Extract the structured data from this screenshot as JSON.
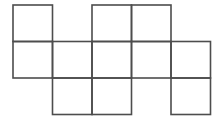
{
  "figure": {
    "name": "grid-square-net",
    "background_color": "#ffffff",
    "line_color": "#4d4d4d",
    "line_width": 1.6,
    "grid": {
      "columns": 5,
      "rows": 3,
      "cell_width": 39.5,
      "cell_height": 36.5,
      "origin_x": 13,
      "origin_y": 5,
      "column_edges_x": [
        13,
        52.5,
        92,
        131.5,
        171,
        210.5
      ],
      "row_edges_y": [
        5,
        41.5,
        78,
        114.5
      ]
    },
    "cells": [
      {
        "id": "cell-r1c1",
        "row": 1,
        "col": 1
      },
      {
        "id": "cell-r1c3",
        "row": 1,
        "col": 3
      },
      {
        "id": "cell-r1c4",
        "row": 1,
        "col": 4
      },
      {
        "id": "cell-r2c1",
        "row": 2,
        "col": 1
      },
      {
        "id": "cell-r2c2",
        "row": 2,
        "col": 2
      },
      {
        "id": "cell-r2c3",
        "row": 2,
        "col": 3
      },
      {
        "id": "cell-r2c4",
        "row": 2,
        "col": 4
      },
      {
        "id": "cell-r2c5",
        "row": 2,
        "col": 5
      },
      {
        "id": "cell-r3c2",
        "row": 3,
        "col": 2
      },
      {
        "id": "cell-r3c3",
        "row": 3,
        "col": 3
      },
      {
        "id": "cell-r3c5",
        "row": 3,
        "col": 5
      }
    ],
    "cell_count": 11
  }
}
